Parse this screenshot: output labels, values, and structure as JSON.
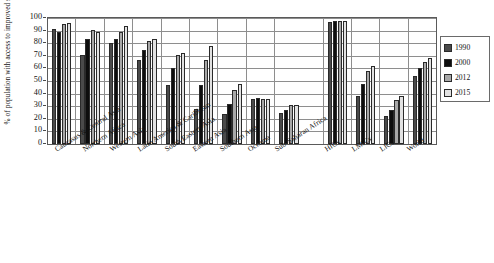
{
  "chart_data": {
    "type": "bar",
    "title": "",
    "xlabel": "",
    "ylabel": "% of population with access to improved sanitation facilities",
    "ylim": [
      0,
      100
    ],
    "ytick_step": 10,
    "grid": true,
    "legend_position": "right",
    "categories": [
      "Caucasus & Central Asia",
      "Northern Africa",
      "Western Asia",
      "Latin America & Caribbean",
      "South Eastern Asia",
      "Eastern Asia",
      "Southern Asia",
      "Oceania",
      "Sub-Saharan Africa",
      "HICs",
      "LMICs",
      "LICs",
      "World"
    ],
    "yticks": [
      "0",
      "10",
      "20",
      "30",
      "40",
      "50",
      "60",
      "70",
      "80",
      "90",
      "100"
    ],
    "series": [
      {
        "name": "1990",
        "color": "#4a4a4a",
        "values": [
          91,
          71,
          80,
          67,
          47,
          27.5,
          23.5,
          36,
          25,
          97,
          38,
          22,
          54
        ]
      },
      {
        "name": "2000",
        "color": "#0d0d0d",
        "values": [
          89,
          83,
          83,
          75,
          60,
          47,
          32,
          36.5,
          27,
          98,
          48,
          27,
          60
        ]
      },
      {
        "name": "2012",
        "color": "#a8a8a8",
        "values": [
          95,
          90.5,
          89,
          82,
          71,
          67,
          43,
          36,
          31,
          98,
          58,
          35,
          65
        ]
      },
      {
        "name": "2015",
        "color": "#e2e2e2",
        "values": [
          96,
          89,
          94,
          83,
          72,
          78,
          48,
          36,
          31,
          98,
          62,
          38,
          68
        ]
      }
    ]
  },
  "legend": {
    "entries": [
      "1990",
      "2000",
      "2012",
      "2015"
    ]
  }
}
